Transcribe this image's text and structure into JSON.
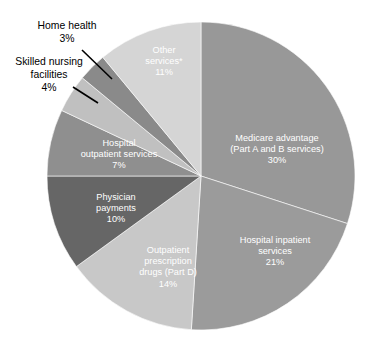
{
  "chart_data": {
    "type": "pie",
    "title": "",
    "subtitle": "",
    "xlabel": "",
    "ylabel": "",
    "legend_position": "none",
    "grid": false,
    "labels_inside": true,
    "start_angle_deg": 0,
    "direction": "clockwise",
    "center": {
      "x": 201,
      "y": 176
    },
    "radius": 154,
    "categories": [
      "Medicare advantage (Part A and B services)",
      "Hospital inpatient services",
      "Outpatient prescription drugs (Part D)",
      "Physician payments",
      "Hospital outpatient services",
      "Skilled nursing facilities",
      "Home health",
      "Other services*"
    ],
    "values": [
      30,
      21,
      14,
      10,
      7,
      4,
      3,
      11
    ],
    "value_labels": [
      "30%",
      "21%",
      "14%",
      "10%",
      "7%",
      "4%",
      "3%",
      "11%"
    ],
    "colors": [
      "#989898",
      "#9b9b9b",
      "#c8c8c8",
      "#666666",
      "#8f8f8f",
      "#c0c0c0",
      "#8a8a8a",
      "#d5d5d5"
    ],
    "slices": [
      {
        "name": "Medicare advantage (Part A and B services)",
        "value": 30,
        "percent_label": "30%",
        "color": "#989898",
        "label_placement": "inside",
        "label_lines": [
          "Medicare advantage",
          "(Part A and B services)",
          "30%"
        ],
        "label_x": 277,
        "label_y": 141
      },
      {
        "name": "Hospital inpatient services",
        "value": 21,
        "percent_label": "21%",
        "color": "#9b9b9b",
        "label_placement": "inside",
        "label_lines": [
          "Hospital inpatient",
          "services",
          "21%"
        ],
        "label_x": 275,
        "label_y": 243
      },
      {
        "name": "Outpatient prescription drugs (Part D)",
        "value": 14,
        "percent_label": "14%",
        "color": "#c8c8c8",
        "label_placement": "inside",
        "label_lines": [
          "Outpatient",
          "prescription",
          "drugs (Part D)",
          "14%"
        ],
        "label_x": 168,
        "label_y": 253
      },
      {
        "name": "Physician payments",
        "value": 10,
        "percent_label": "10%",
        "color": "#666666",
        "label_placement": "inside",
        "label_lines": [
          "Physician",
          "payments",
          "10%"
        ],
        "label_x": 116,
        "label_y": 200
      },
      {
        "name": "Hospital outpatient services",
        "value": 7,
        "percent_label": "7%",
        "color": "#8f8f8f",
        "label_placement": "inside",
        "label_lines": [
          "Hospital",
          "outpatient services",
          "7%"
        ],
        "label_x": 119,
        "label_y": 146
      },
      {
        "name": "Skilled nursing facilities",
        "value": 4,
        "percent_label": "4%",
        "color": "#c0c0c0",
        "label_placement": "callout",
        "label_lines": [
          "Skilled nursing",
          "facilities",
          "4%"
        ],
        "label_x": 49,
        "label_y": 65,
        "leader": {
          "x1": 73,
          "y1": 87,
          "x2": 98,
          "y2": 103
        }
      },
      {
        "name": "Home health",
        "value": 3,
        "percent_label": "3%",
        "color": "#8a8a8a",
        "label_placement": "callout",
        "label_lines": [
          "Home health",
          "3%"
        ],
        "label_x": 67,
        "label_y": 29,
        "leader": {
          "x1": 82,
          "y1": 50,
          "x2": 112,
          "y2": 79
        }
      },
      {
        "name": "Other services*",
        "value": 11,
        "percent_label": "11%",
        "color": "#d5d5d5",
        "label_placement": "inside",
        "label_lines": [
          "Other",
          "services*",
          "11%"
        ],
        "label_x": 164,
        "label_y": 53
      }
    ]
  }
}
